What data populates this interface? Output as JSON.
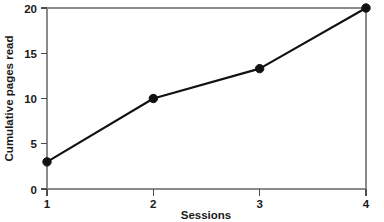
{
  "chart_data": {
    "type": "line",
    "title": "",
    "xlabel": "Sessions",
    "ylabel": "Cumulative pages read",
    "x": [
      1,
      2,
      3,
      4
    ],
    "values": [
      3,
      10,
      13.3,
      20
    ],
    "xlim": [
      1,
      4
    ],
    "ylim": [
      0,
      20
    ],
    "xticks": [
      1,
      2,
      3,
      4
    ],
    "xtick_labels": [
      "1",
      "2",
      "3",
      "4"
    ],
    "yticks": [
      0,
      5,
      10,
      15,
      20
    ],
    "ytick_labels": [
      "0",
      "5",
      "10",
      "15",
      "20"
    ],
    "grid": false,
    "legend": null,
    "marker": "filled-circle",
    "line_color": "#111111",
    "marker_color": "#111111",
    "frame_color": "#8a8a8a",
    "background_color": "#ffffff"
  },
  "axes": {
    "x_title": "Sessions",
    "y_title": "Cumulative pages read"
  },
  "ticks": {
    "y": [
      {
        "label": "20",
        "value": 20
      },
      {
        "label": "15",
        "value": 15
      },
      {
        "label": "10",
        "value": 10
      },
      {
        "label": "5",
        "value": 5
      },
      {
        "label": "0",
        "value": 0
      }
    ],
    "x": [
      {
        "label": "1",
        "value": 1
      },
      {
        "label": "2",
        "value": 2
      },
      {
        "label": "3",
        "value": 3
      },
      {
        "label": "4",
        "value": 4
      }
    ]
  }
}
